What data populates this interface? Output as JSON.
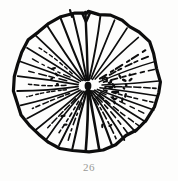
{
  "plate": {
    "background_color": "#fdfdfc",
    "ink_color": "#0d0d0d",
    "caption_color": "#9a9a96"
  },
  "caption": {
    "figure_number": "26"
  },
  "figure": {
    "title": "26",
    "outline_style": "irregular hand-inked closed contour",
    "center_x": 88,
    "center_y": 86,
    "notch_top": true
  },
  "chart_data": {
    "type": "scatter",
    "title": "26",
    "subtitle": "",
    "xlabel": "",
    "ylabel": "",
    "grid": false,
    "legend": null,
    "xlim": [
      0,
      178
    ],
    "ylim": [
      0,
      160
    ],
    "center": [
      88,
      86
    ],
    "outline": [
      [
        88,
        12
      ],
      [
        99,
        13
      ],
      [
        110,
        15
      ],
      [
        121,
        19
      ],
      [
        131,
        25
      ],
      [
        140,
        33
      ],
      [
        148,
        43
      ],
      [
        154,
        55
      ],
      [
        158,
        68
      ],
      [
        159,
        81
      ],
      [
        158,
        94
      ],
      [
        154,
        107
      ],
      [
        147,
        119
      ],
      [
        138,
        129
      ],
      [
        127,
        137
      ],
      [
        115,
        144
      ],
      [
        102,
        149
      ],
      [
        88,
        151
      ],
      [
        74,
        151
      ],
      [
        61,
        148
      ],
      [
        49,
        143
      ],
      [
        38,
        135
      ],
      [
        29,
        126
      ],
      [
        22,
        115
      ],
      [
        17,
        103
      ],
      [
        14,
        90
      ],
      [
        14,
        77
      ],
      [
        17,
        64
      ],
      [
        22,
        52
      ],
      [
        29,
        41
      ],
      [
        38,
        32
      ],
      [
        49,
        24
      ],
      [
        61,
        18
      ],
      [
        74,
        14
      ],
      [
        88,
        12
      ]
    ],
    "series": [
      {
        "name": "solid-rays",
        "style": "solid",
        "values": [
          {
            "angle_deg": 268,
            "r_start": 6,
            "r_end": 74,
            "width": 2.4
          },
          {
            "angle_deg": 280,
            "r_start": 6,
            "r_end": 72,
            "width": 1.9
          },
          {
            "angle_deg": 292,
            "r_start": 8,
            "r_end": 71,
            "width": 1.7
          },
          {
            "angle_deg": 304,
            "r_start": 8,
            "r_end": 70,
            "width": 1.6
          },
          {
            "angle_deg": 316,
            "r_start": 10,
            "r_end": 70,
            "width": 1.5
          },
          {
            "angle_deg": 340,
            "r_start": 12,
            "r_end": 71,
            "width": 1.4
          },
          {
            "angle_deg": 356,
            "r_start": 14,
            "r_end": 71,
            "width": 1.6
          },
          {
            "angle_deg": 8,
            "r_start": 12,
            "r_end": 71,
            "width": 1.5
          },
          {
            "angle_deg": 20,
            "r_start": 10,
            "r_end": 70,
            "width": 1.6
          },
          {
            "angle_deg": 32,
            "r_start": 8,
            "r_end": 68,
            "width": 1.7
          },
          {
            "angle_deg": 44,
            "r_start": 7,
            "r_end": 66,
            "width": 1.8
          },
          {
            "angle_deg": 56,
            "r_start": 6,
            "r_end": 65,
            "width": 1.9
          },
          {
            "angle_deg": 68,
            "r_start": 5,
            "r_end": 64,
            "width": 2.2
          },
          {
            "angle_deg": 80,
            "r_start": 4,
            "r_end": 64,
            "width": 2.6
          },
          {
            "angle_deg": 92,
            "r_start": 4,
            "r_end": 64,
            "width": 2.6
          },
          {
            "angle_deg": 104,
            "r_start": 5,
            "r_end": 65,
            "width": 2.1
          },
          {
            "angle_deg": 116,
            "r_start": 6,
            "r_end": 66,
            "width": 1.9
          },
          {
            "angle_deg": 128,
            "r_start": 7,
            "r_end": 67,
            "width": 1.8
          },
          {
            "angle_deg": 140,
            "r_start": 8,
            "r_end": 68,
            "width": 1.8
          },
          {
            "angle_deg": 152,
            "r_start": 9,
            "r_end": 69,
            "width": 1.7
          },
          {
            "angle_deg": 164,
            "r_start": 10,
            "r_end": 70,
            "width": 1.7
          },
          {
            "angle_deg": 176,
            "r_start": 10,
            "r_end": 71,
            "width": 1.8
          },
          {
            "angle_deg": 188,
            "r_start": 10,
            "r_end": 71,
            "width": 1.7
          },
          {
            "angle_deg": 200,
            "r_start": 10,
            "r_end": 72,
            "width": 1.6
          },
          {
            "angle_deg": 212,
            "r_start": 9,
            "r_end": 72,
            "width": 1.6
          },
          {
            "angle_deg": 224,
            "r_start": 8,
            "r_end": 73,
            "width": 1.7
          },
          {
            "angle_deg": 236,
            "r_start": 7,
            "r_end": 74,
            "width": 1.9
          },
          {
            "angle_deg": 248,
            "r_start": 6,
            "r_end": 74,
            "width": 2.1
          },
          {
            "angle_deg": 258,
            "r_start": 6,
            "r_end": 74,
            "width": 2.0
          }
        ]
      },
      {
        "name": "dashed-rays",
        "style": "dashed",
        "values": [
          {
            "angle_deg": 328,
            "r_start": 14,
            "r_end": 70,
            "width": 2.0
          },
          {
            "angle_deg": 334,
            "r_start": 16,
            "r_end": 68,
            "width": 1.8
          },
          {
            "angle_deg": 346,
            "r_start": 16,
            "r_end": 69,
            "width": 1.7
          },
          {
            "angle_deg": 2,
            "r_start": 18,
            "r_end": 68,
            "width": 1.6
          },
          {
            "angle_deg": 14,
            "r_start": 16,
            "r_end": 67,
            "width": 1.6
          },
          {
            "angle_deg": 26,
            "r_start": 14,
            "r_end": 66,
            "width": 1.5
          },
          {
            "angle_deg": 38,
            "r_start": 14,
            "r_end": 64,
            "width": 1.5
          },
          {
            "angle_deg": 50,
            "r_start": 14,
            "r_end": 62,
            "width": 1.6
          },
          {
            "angle_deg": 62,
            "r_start": 14,
            "r_end": 60,
            "width": 1.6
          },
          {
            "angle_deg": 110,
            "r_start": 18,
            "r_end": 58,
            "width": 1.6
          },
          {
            "angle_deg": 122,
            "r_start": 18,
            "r_end": 58,
            "width": 1.6
          },
          {
            "angle_deg": 134,
            "r_start": 18,
            "r_end": 58,
            "width": 1.5
          },
          {
            "angle_deg": 158,
            "r_start": 20,
            "r_end": 60,
            "width": 1.5
          },
          {
            "angle_deg": 170,
            "r_start": 22,
            "r_end": 62,
            "width": 1.5
          },
          {
            "angle_deg": 182,
            "r_start": 22,
            "r_end": 62,
            "width": 1.5
          },
          {
            "angle_deg": 194,
            "r_start": 22,
            "r_end": 62,
            "width": 1.5
          },
          {
            "angle_deg": 206,
            "r_start": 20,
            "r_end": 62,
            "width": 1.4
          },
          {
            "angle_deg": 218,
            "r_start": 20,
            "r_end": 62,
            "width": 1.4
          }
        ]
      },
      {
        "name": "stipple-dots",
        "style": "dots",
        "values": [
          {
            "angle_deg": 340,
            "r": 20,
            "size": 1.8
          },
          {
            "angle_deg": 346,
            "r": 24,
            "size": 2.0
          },
          {
            "angle_deg": 352,
            "r": 22,
            "size": 1.6
          },
          {
            "angle_deg": 358,
            "r": 26,
            "size": 1.9
          },
          {
            "angle_deg": 4,
            "r": 24,
            "size": 1.7
          },
          {
            "angle_deg": 10,
            "r": 28,
            "size": 2.1
          },
          {
            "angle_deg": 16,
            "r": 26,
            "size": 1.8
          },
          {
            "angle_deg": 22,
            "r": 30,
            "size": 1.7
          },
          {
            "angle_deg": 28,
            "r": 28,
            "size": 2.0
          },
          {
            "angle_deg": 34,
            "r": 32,
            "size": 1.8
          },
          {
            "angle_deg": 342,
            "r": 34,
            "size": 1.7
          },
          {
            "angle_deg": 350,
            "r": 36,
            "size": 2.0
          },
          {
            "angle_deg": 358,
            "r": 38,
            "size": 1.8
          },
          {
            "angle_deg": 6,
            "r": 36,
            "size": 1.7
          },
          {
            "angle_deg": 14,
            "r": 40,
            "size": 1.9
          },
          {
            "angle_deg": 20,
            "r": 38,
            "size": 1.6
          },
          {
            "angle_deg": 2,
            "r": 16,
            "size": 1.5
          },
          {
            "angle_deg": 12,
            "r": 18,
            "size": 1.6
          },
          {
            "angle_deg": 352,
            "r": 44,
            "size": 1.7
          },
          {
            "angle_deg": 344,
            "r": 42,
            "size": 1.6
          },
          {
            "angle_deg": 200,
            "r": 34,
            "size": 1.8
          },
          {
            "angle_deg": 208,
            "r": 40,
            "size": 1.7
          },
          {
            "angle_deg": 190,
            "r": 38,
            "size": 1.6
          },
          {
            "angle_deg": 182,
            "r": 32,
            "size": 1.7
          },
          {
            "angle_deg": 120,
            "r": 44,
            "size": 1.7
          },
          {
            "angle_deg": 130,
            "r": 40,
            "size": 1.6
          },
          {
            "angle_deg": 60,
            "r": 46,
            "size": 1.7
          },
          {
            "angle_deg": 70,
            "r": 42,
            "size": 1.6
          }
        ]
      }
    ]
  }
}
